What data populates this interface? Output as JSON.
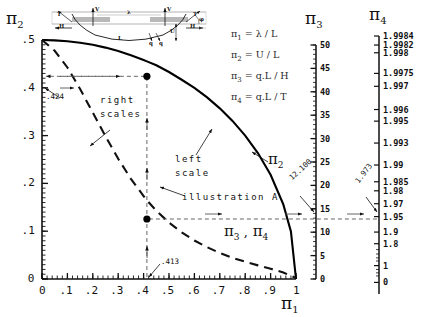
{
  "chart_data": {
    "type": "line",
    "title": "",
    "xlabel": "π1",
    "ylabel": "π2",
    "xlim": [
      0,
      1
    ],
    "ylim": [
      0,
      0.5
    ],
    "grid": false,
    "legend_position": "inline-annotations",
    "x_ticks": [
      "0",
      ".1",
      ".2",
      ".3",
      ".4",
      ".5",
      ".6",
      ".7",
      ".8",
      ".9",
      "1"
    ],
    "x_tick_values": [
      0,
      0.1,
      0.2,
      0.3,
      0.4,
      0.5,
      0.6,
      0.7,
      0.8,
      0.9,
      1
    ],
    "y_ticks": [
      "0",
      ".1",
      ".2",
      ".3",
      ".4",
      ".5"
    ],
    "y_tick_values": [
      0,
      0.1,
      0.2,
      0.3,
      0.4,
      0.5
    ],
    "series": [
      {
        "name": "π2",
        "style": "solid",
        "scale": "left",
        "scale_label": "left scale",
        "x": [
          0,
          0.05,
          0.1,
          0.15,
          0.2,
          0.25,
          0.3,
          0.35,
          0.4,
          0.413,
          0.45,
          0.5,
          0.55,
          0.6,
          0.65,
          0.7,
          0.75,
          0.8,
          0.85,
          0.9,
          0.95,
          0.98,
          1
        ],
        "values": [
          0.5,
          0.4993,
          0.4975,
          0.4944,
          0.49,
          0.4841,
          0.4769,
          0.468,
          0.4582,
          0.4552,
          0.4472,
          0.433,
          0.4168,
          0.4,
          0.3799,
          0.357,
          0.3307,
          0.3,
          0.2634,
          0.218,
          0.156,
          0.0995,
          0
        ]
      },
      {
        "name": "π3, π4",
        "style": "dashed",
        "scale": "right",
        "scale_label": "right scales",
        "x": [
          0,
          0.05,
          0.1,
          0.15,
          0.2,
          0.25,
          0.3,
          0.35,
          0.4,
          0.413,
          0.45,
          0.5,
          0.55,
          0.6,
          0.65,
          0.7,
          0.75,
          0.8,
          0.85,
          0.9,
          0.95,
          1
        ],
        "values": [
          0.5,
          0.4775,
          0.4425,
          0.3975,
          0.348,
          0.2985,
          0.2515,
          0.2095,
          0.1735,
          0.1645,
          0.143,
          0.118,
          0.0975,
          0.0805,
          0.0665,
          0.0545,
          0.0445,
          0.036,
          0.0285,
          0.0215,
          0.0135,
          0.002
        ]
      }
    ],
    "markers": [
      {
        "name": "pi2-point",
        "x": 0.413,
        "y": 0.424,
        "on": "π2"
      },
      {
        "name": "pi34-point",
        "x": 0.413,
        "y": 0.1255,
        "on": "π3, π4"
      }
    ],
    "annotations": {
      "pi2_value": ".424",
      "pi1_value": ".413",
      "pi3_value": "12.100",
      "pi4_value": "1.973",
      "illustration": "illustration A",
      "left_scale": "left scale",
      "right_scales": "right scales",
      "curve_label_pi2": "π2",
      "curve_label_pi34": "π3 , π4"
    },
    "right_axis_pi3": {
      "label": "π3",
      "range": [
        0,
        50
      ],
      "ticks": [
        "50",
        "45",
        "40",
        "35",
        "30",
        "25",
        "20",
        "15",
        "10",
        "5",
        "0"
      ],
      "tick_values": [
        50,
        45,
        40,
        35,
        30,
        25,
        20,
        15,
        10,
        5,
        0
      ],
      "marker_value": 12.1
    },
    "right_axis_pi4": {
      "label": "π4",
      "scale": "nonlinear",
      "ticks": [
        "1.9984",
        "1.9982",
        "1.998",
        "1.9975",
        "1.997",
        "1.996",
        "1.995",
        "1.993",
        "1.99",
        "1.985",
        "1.98",
        "1.97",
        "1.95",
        "1.9",
        "1.8",
        "1",
        "0"
      ],
      "tick_values": [
        1.9984,
        1.9982,
        1.998,
        1.9975,
        1.997,
        1.996,
        1.995,
        1.993,
        1.99,
        1.985,
        1.98,
        1.97,
        1.95,
        1.9,
        1.8,
        1,
        0
      ],
      "marker_value": 1.973
    }
  },
  "headers": {
    "pi2": "π",
    "pi2_sub": "2",
    "pi3": "π",
    "pi3_sub": "3",
    "pi4": "π",
    "pi4_sub": "4",
    "pi1": "π",
    "pi1_sub": "1"
  },
  "formulas": [
    {
      "lhs": "π",
      "sub": "1",
      "rhs": "= λ / L"
    },
    {
      "lhs": "π",
      "sub": "2",
      "rhs": "= U / L"
    },
    {
      "lhs": "π",
      "sub": "3",
      "rhs": "= q.L / H"
    },
    {
      "lhs": "π",
      "sub": "4",
      "rhs": "= q.L / T"
    }
  ],
  "inset": {
    "name": "cable-sag-diagram",
    "labels": {
      "T_left": "T",
      "T_right": "T",
      "V_left": "V",
      "V_right": "V",
      "H_left": "H",
      "H_right": "H",
      "lambda": "λ",
      "L": "L",
      "U": "U",
      "q_left": "q",
      "q_right": "q",
      "phi": "φ"
    }
  },
  "colors": {
    "ink": "#111111",
    "curve": "#000000",
    "dash": "#333333",
    "guide": "#555555",
    "formula": "#2a2a2a"
  }
}
